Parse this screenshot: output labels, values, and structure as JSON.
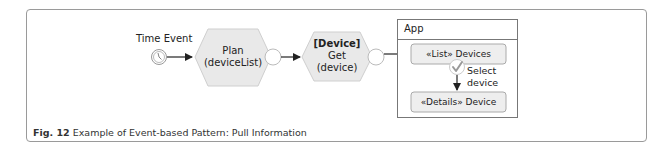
{
  "figure": {
    "caption_label": "Fig. 12",
    "caption_text": " Example of Event-based Pattern: Pull Information"
  },
  "diagram": {
    "start_event": {
      "label": "Time Event",
      "icon": "timer-icon"
    },
    "steps": [
      {
        "id": "plan",
        "type": "hexagon",
        "line1": "Plan",
        "line2": "(deviceList)"
      },
      {
        "id": "get",
        "type": "hexagon",
        "line1_bold": "[Device]",
        "line2": "Get",
        "line3": "(device)"
      }
    ],
    "app": {
      "title": "App",
      "screens": [
        {
          "label": "«List» Devices"
        },
        {
          "label": "«Details» Device"
        }
      ],
      "transition": {
        "icon": "check-icon",
        "line1": "Select",
        "line2": "device"
      }
    }
  },
  "colors": {
    "hex_fill": "#e9e9e9",
    "hex_stroke": "#cccccc",
    "box_fill": "#eeeeee",
    "frame_stroke": "#9a9a9a",
    "arrow": "#222222",
    "check": "#999999"
  }
}
